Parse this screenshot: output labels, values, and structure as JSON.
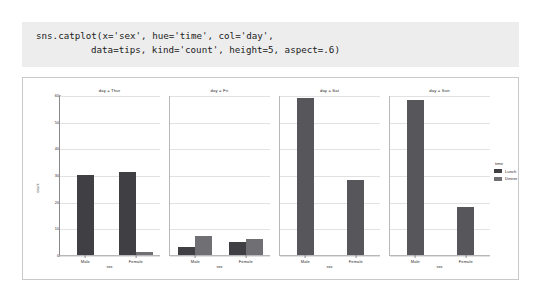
{
  "code": {
    "line1": "sns.catplot(x='sex', hue='time', col='day',",
    "line2": "data=tips, kind='count', height=5, aspect=.6)"
  },
  "legend": {
    "title": "time",
    "entries": [
      {
        "label": "Lunch",
        "color": "#404044"
      },
      {
        "label": "Dinner",
        "color": "#6f6f74"
      }
    ]
  },
  "chart_data": {
    "type": "bar",
    "title": "",
    "xlabel": "sex",
    "ylabel": "count",
    "ylim": [
      0,
      60
    ],
    "yticks": [
      0,
      10,
      20,
      30,
      40,
      50,
      60
    ],
    "ytick_labels": [
      "0",
      "10",
      "20",
      "30",
      "40",
      "50",
      "60"
    ],
    "grid": true,
    "legend_position": "right",
    "legend_title": "time",
    "categories": [
      "Male",
      "Female"
    ],
    "facet_variable": "day",
    "facets": [
      {
        "title": "day = Thur",
        "day": "Thur",
        "series": [
          {
            "name": "Lunch",
            "color": "#404044",
            "values": [
              30,
              31
            ]
          },
          {
            "name": "Dinner",
            "color": "#6f6f74",
            "values": [
              0,
              1
            ]
          }
        ]
      },
      {
        "title": "day = Fri",
        "day": "Fri",
        "series": [
          {
            "name": "Lunch",
            "color": "#404044",
            "values": [
              3,
              5
            ]
          },
          {
            "name": "Dinner",
            "color": "#6f6f74",
            "values": [
              7,
              6
            ]
          }
        ]
      },
      {
        "title": "day = Sat",
        "day": "Sat",
        "series": [
          {
            "name": "Lunch",
            "color": "#404044",
            "values": [
              0,
              0
            ]
          },
          {
            "name": "Dinner",
            "color": "#56565b",
            "values": [
              59,
              28
            ]
          }
        ]
      },
      {
        "title": "day = Sun",
        "day": "Sun",
        "series": [
          {
            "name": "Lunch",
            "color": "#404044",
            "values": [
              0,
              0
            ]
          },
          {
            "name": "Dinner",
            "color": "#56565b",
            "values": [
              58,
              18
            ]
          }
        ]
      }
    ]
  }
}
